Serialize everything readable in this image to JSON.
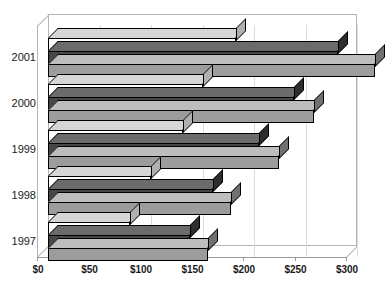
{
  "chart_data": {
    "type": "bar",
    "orientation": "horizontal",
    "style": "3d-grouped-horizontal-bar",
    "title": "",
    "xlabel": "",
    "ylabel": "",
    "categories": [
      "1997",
      "1998",
      "1999",
      "2000",
      "2001"
    ],
    "category_order_top_to_bottom": [
      "2001",
      "2000",
      "1999",
      "1998",
      "1997"
    ],
    "series": [
      {
        "name": "Series 1",
        "color": "#ffffff",
        "values": [
          80,
          100,
          131,
          150,
          183
        ]
      },
      {
        "name": "Series 2",
        "color": "#474747",
        "values": [
          138,
          160,
          205,
          239,
          282
        ]
      },
      {
        "name": "Series 3",
        "color": "#9c9c9c",
        "values": [
          155,
          178,
          224,
          258,
          317
        ]
      }
    ],
    "xlim": [
      0,
      300
    ],
    "xticks": [
      0,
      50,
      100,
      150,
      200,
      250,
      300
    ],
    "xtick_labels": [
      "$0",
      "$50",
      "$100",
      "$150",
      "$200",
      "$250",
      "$300"
    ],
    "grid": true,
    "legend": "none"
  },
  "axis": {
    "x_tick_labels": [
      "$0",
      "$50",
      "$100",
      "$150",
      "$200",
      "$250",
      "$300"
    ],
    "y_tick_labels": [
      "2001",
      "2000",
      "1999",
      "1998",
      "1997"
    ]
  },
  "colors": {
    "series_1": "#ffffff",
    "series_2": "#474747",
    "series_3": "#9c9c9c",
    "grid": "#dcdcdc",
    "axis": "#9a9a9a",
    "outline": "#000000",
    "background": "#ffffff"
  }
}
